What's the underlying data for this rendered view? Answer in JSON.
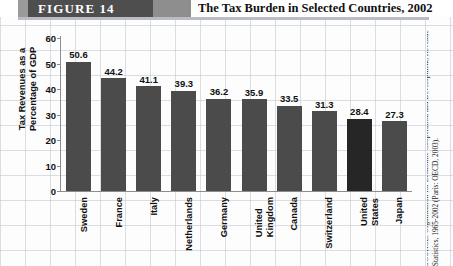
{
  "header": {
    "figure_label": "FIGURE   14",
    "title": "The Tax Burden in Selected Countries, 2002"
  },
  "source": {
    "text": "SOURCE: Organization for Economic Cooperation and Development, Revenue Statistics, 1965-2002 (Paris: OECD, 2003)."
  },
  "colors": {
    "bar": "#4b4b4b",
    "bar_highlight": "#262626",
    "band": "#4e4e4e",
    "axis": "#8d8d8d"
  },
  "chart_data": {
    "type": "bar",
    "title": "The Tax Burden in Selected Countries, 2002",
    "xlabel": "",
    "ylabel": "Tax Revenues as a\nPercentage of GDP",
    "ylim": [
      0,
      60
    ],
    "yticks": [
      60,
      50,
      40,
      30,
      20,
      10,
      0
    ],
    "grid": false,
    "legend": null,
    "categories": [
      "Sweden",
      "France",
      "Italy",
      "Netherlands",
      "Germany",
      "United\nKingdom",
      "Canada",
      "Switzerland",
      "United\nStates",
      "Japan"
    ],
    "values": [
      50.6,
      44.2,
      41.1,
      39.3,
      36.2,
      35.9,
      33.5,
      31.3,
      28.4,
      27.3
    ],
    "value_labels": [
      "50.6",
      "44.2",
      "41.1",
      "39.3",
      "36.2",
      "35.9",
      "33.5",
      "31.3",
      "28.4",
      "27.3"
    ],
    "highlight_index": 8
  }
}
